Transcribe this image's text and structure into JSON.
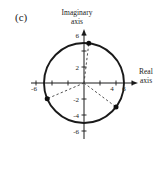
{
  "figure_label": "(c)",
  "axis_titles": {
    "imaginary": [
      "Imaginary",
      "axis"
    ],
    "real": [
      "Real",
      "axis"
    ]
  },
  "colors": {
    "ink": "#1a1a1a",
    "dash": "#3d3d3d",
    "point": "#0f0f0f",
    "background": "#ffffff"
  },
  "chart_data": {
    "type": "scatter",
    "xlabel": "Real axis",
    "ylabel": "Imaginary axis",
    "xlim": [
      -7,
      7
    ],
    "ylim": [
      -7,
      7
    ],
    "grid": false,
    "tick_values": [
      -6,
      -4,
      -2,
      2,
      4,
      6
    ],
    "x_axis_labeled_ticks": [
      -6,
      4,
      6
    ],
    "y_axis_labeled_ticks": [
      6,
      2,
      -2,
      -4,
      -6
    ],
    "circle": {
      "cx": 0,
      "cy": 0,
      "r": 5
    },
    "points": [
      {
        "x": 0.6,
        "y": 4.96
      },
      {
        "x": -4.6,
        "y": -1.96
      },
      {
        "x": 4.0,
        "y": -3.0
      }
    ],
    "dashed_radii_from_origin": true
  }
}
